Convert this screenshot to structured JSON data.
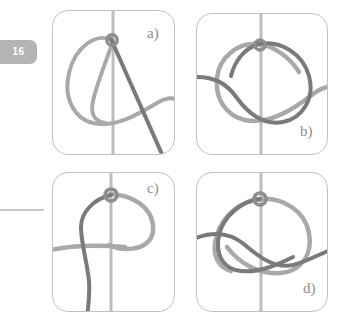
{
  "page": {
    "page_number": "16",
    "background_color": "#ffffff",
    "tab_color": "#b4b4b4",
    "tab_text_color": "#ffffff",
    "rule_color": "#c9c9c9",
    "panel_border_color": "#c2c2c2",
    "light_curve_color": "#a9a9a9",
    "dark_curve_color": "#7a7a7a",
    "axis_color": "#bdbdbd",
    "label_color": "#8d8d8d"
  },
  "figure": {
    "panels": [
      {
        "id": "a",
        "label": "a)",
        "description": "closed light-gray loop crossing a vertical axis with a straight dark diagonal strand passing through the crossing node"
      },
      {
        "id": "b",
        "label": "b)",
        "description": "dark closed loop and light figure-eight strand crossing at a node on the vertical axis"
      },
      {
        "id": "c",
        "label": "c)",
        "description": "light teardrop loop with dark vertical strand through the node and a light horizontal strand"
      },
      {
        "id": "d",
        "label": "d)",
        "description": "dark closed loop with a light figure-eight strand crossing at a node on the vertical axis"
      }
    ]
  }
}
